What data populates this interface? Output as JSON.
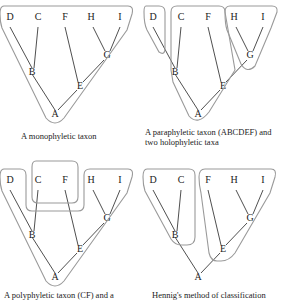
{
  "figure": {
    "panels": [
      {
        "id": "monophyletic",
        "caption_lines": [
          "A monophyletic taxon"
        ],
        "groups": [
          "ABCDEFGHI"
        ]
      },
      {
        "id": "paraphyletic",
        "caption_lines": [
          "A paraphyletic taxon (ABCDEF) and",
          "two holophyletic taxa"
        ],
        "groups": [
          "D",
          "ABCEF",
          "GHI"
        ]
      },
      {
        "id": "polyphyletic",
        "caption_lines": [
          "A polyphyletic taxon (CF) and a"
        ],
        "groups": [
          "CF",
          "ABDEGHI"
        ]
      },
      {
        "id": "hennig",
        "caption_lines": [
          "Hennig's method of classification"
        ],
        "groups": [
          "BCD",
          "EFGHI"
        ]
      }
    ],
    "nodes": {
      "tips": [
        "D",
        "C",
        "F",
        "H",
        "I"
      ],
      "internal": [
        "B",
        "G",
        "E",
        "A"
      ]
    },
    "edges": [
      [
        "A",
        "B"
      ],
      [
        "B",
        "D"
      ],
      [
        "B",
        "C"
      ],
      [
        "A",
        "E"
      ],
      [
        "E",
        "F"
      ],
      [
        "E",
        "G"
      ],
      [
        "G",
        "H"
      ],
      [
        "G",
        "I"
      ]
    ],
    "colors": {
      "line": "#222222",
      "outline": "#9a9a9a"
    }
  }
}
